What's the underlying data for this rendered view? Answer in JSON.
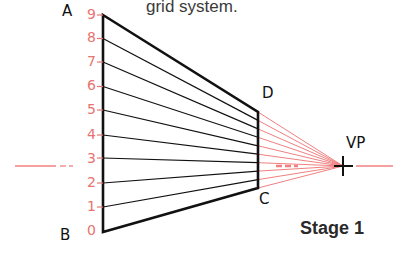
{
  "caption": "grid system.",
  "stage_label": "Stage 1",
  "points": {
    "A": "A",
    "B": "B",
    "C": "C",
    "D": "D",
    "VP": "VP"
  },
  "scale_ticks": [
    "0",
    "1",
    "2",
    "3",
    "4",
    "5",
    "6",
    "7",
    "8",
    "9"
  ],
  "colors": {
    "construction": "#f08080",
    "outline": "#111111",
    "scale": "#e8736f"
  }
}
